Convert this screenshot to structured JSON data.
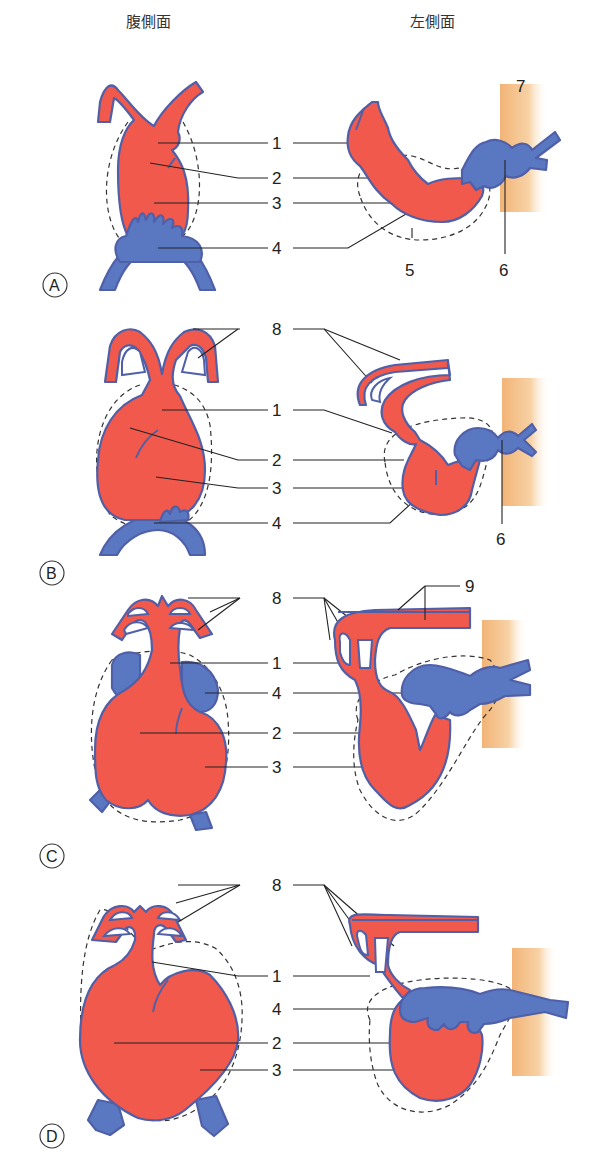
{
  "headers": {
    "ventral": "腹側面",
    "left_side": "左側面"
  },
  "colors": {
    "arterial_red": "#f0594c",
    "venous_blue": "#5a78c2",
    "outline": "#4f5fa8",
    "body_wall": "#f5c48c"
  },
  "panels": [
    {
      "stage": "A",
      "ventral_labels": [
        "1",
        "2",
        "3",
        "4"
      ],
      "lateral_labels": [
        "1",
        "2",
        "3",
        "4",
        "5",
        "6",
        "7"
      ]
    },
    {
      "stage": "B",
      "ventral_labels": [
        "8",
        "1",
        "2",
        "3",
        "4"
      ],
      "lateral_labels": [
        "8",
        "1",
        "2",
        "3",
        "4",
        "6"
      ]
    },
    {
      "stage": "C",
      "ventral_labels": [
        "8",
        "1",
        "4",
        "2",
        "3"
      ],
      "lateral_labels": [
        "8",
        "9",
        "1",
        "4",
        "2",
        "3"
      ]
    },
    {
      "stage": "D",
      "ventral_labels": [
        "8",
        "1",
        "4",
        "2",
        "3"
      ],
      "lateral_labels": [
        "8",
        "1",
        "4",
        "2",
        "3"
      ]
    }
  ]
}
